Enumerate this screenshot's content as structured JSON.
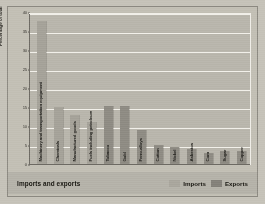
{
  "caption": {
    "title": "Imports and exports"
  },
  "legend": {
    "position": "bottom-right",
    "items": [
      {
        "label": "Imports",
        "color": "#a9a69d"
      },
      {
        "label": "Exports",
        "color": "#84817a"
      }
    ]
  },
  "chart_data": {
    "type": "bar",
    "title": "Imports and exports",
    "xlabel": "",
    "ylabel": "Percentage of total",
    "ylim": [
      0,
      40
    ],
    "yticks": [
      0,
      5,
      10,
      15,
      20,
      25,
      30,
      35,
      40
    ],
    "grid": true,
    "categories": [
      "Machinery and transportation equipment",
      "Chemicals",
      "Manufactured goods",
      "Fuels including petroleum",
      "Tobacco",
      "Gold",
      "Ferro-alloys",
      "Cotton",
      "Nickel",
      "Asbestos",
      "Corn",
      "Sugar",
      "Copper"
    ],
    "series": [
      {
        "name": "Imports",
        "values": [
          38,
          15,
          13,
          11,
          null,
          null,
          null,
          null,
          null,
          null,
          null,
          null,
          null
        ]
      },
      {
        "name": "Exports",
        "values": [
          null,
          null,
          null,
          null,
          15.5,
          15.5,
          9,
          5,
          4.5,
          4,
          3,
          3.5,
          3.5
        ]
      }
    ],
    "bars": [
      {
        "category": "Machinery and transportation equipment",
        "value": 38,
        "series": "Imports"
      },
      {
        "category": "Chemicals",
        "value": 15,
        "series": "Imports"
      },
      {
        "category": "Manufactured goods",
        "value": 13,
        "series": "Imports"
      },
      {
        "category": "Fuels including petroleum",
        "value": 11,
        "series": "Imports"
      },
      {
        "category": "Tobacco",
        "value": 15.5,
        "series": "Exports"
      },
      {
        "category": "Gold",
        "value": 15.5,
        "series": "Exports"
      },
      {
        "category": "Ferro-alloys",
        "value": 9,
        "series": "Exports"
      },
      {
        "category": "Cotton",
        "value": 5,
        "series": "Exports"
      },
      {
        "category": "Nickel",
        "value": 4.5,
        "series": "Exports"
      },
      {
        "category": "Asbestos",
        "value": 4,
        "series": "Exports"
      },
      {
        "category": "Corn",
        "value": 3,
        "series": "Exports"
      },
      {
        "category": "Sugar",
        "value": 3.5,
        "series": "Exports"
      },
      {
        "category": "Copper",
        "value": 3.5,
        "series": "Exports"
      }
    ]
  }
}
